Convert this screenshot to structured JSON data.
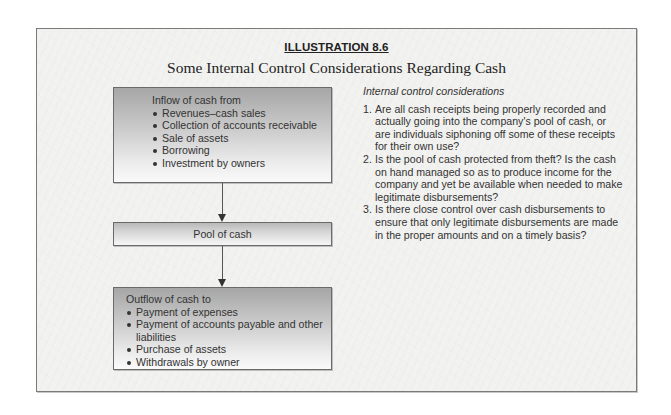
{
  "illustration": {
    "label": "ILLUSTRATION 8.6",
    "title": "Some Internal Control Considerations Regarding Cash"
  },
  "flow": {
    "inflow": {
      "heading": "Inflow of cash from",
      "items": [
        "Revenues–cash sales",
        "Collection of accounts receivable",
        "Sale of assets",
        "Borrowing",
        "Investment by owners"
      ]
    },
    "pool": {
      "label": "Pool of cash"
    },
    "outflow": {
      "heading": "Outflow of cash to",
      "items": [
        "Payment of expenses",
        "Payment of accounts payable and other liabilities",
        "Purchase of assets",
        "Withdrawals by owner"
      ]
    }
  },
  "considerations": {
    "heading": "Internal control considerations",
    "items": [
      {
        "number": "1.",
        "text": "Are all cash receipts being properly recorded and actually going into the company's pool of cash, or are individuals siphoning off some of these receipts for their own use?"
      },
      {
        "number": "2.",
        "text": "Is the pool of cash protected from theft? Is the cash on hand managed so as to produce income for the company and yet be available when needed to make legitimate disbursements?"
      },
      {
        "number": "3.",
        "text": "Is there close control over cash disbursements to ensure that only legitimate disbursements are made in the proper amounts and on a timely basis?"
      }
    ]
  },
  "icons": {
    "arrow": "arrow-down-icon",
    "bullet": "bullet-icon"
  },
  "colors": {
    "frame_border": "#7a7a7a",
    "box_gradient_top": "#a6a6a6",
    "box_gradient_bottom": "#fafafa",
    "text": "#333333"
  }
}
